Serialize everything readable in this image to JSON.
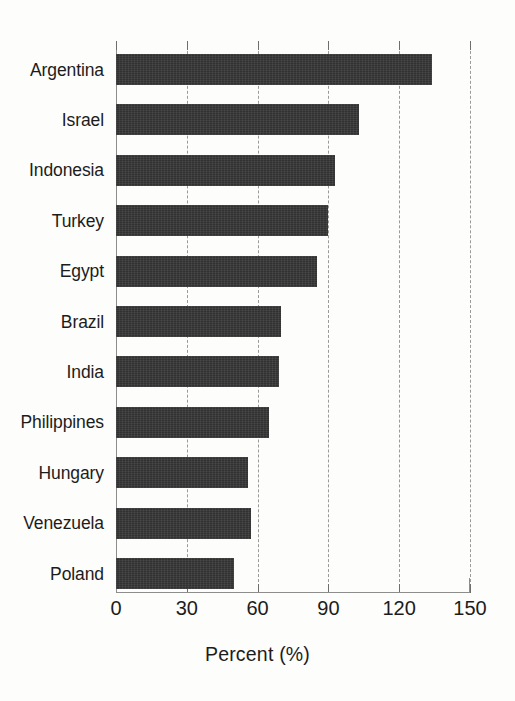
{
  "chart_data": {
    "type": "bar",
    "orientation": "horizontal",
    "title": "",
    "subtitle": "",
    "xlabel": "Percent (%)",
    "ylabel": "",
    "xlim": [
      0,
      150
    ],
    "xticks": [
      0,
      30,
      60,
      90,
      120,
      150
    ],
    "xtick_labels": [
      "0",
      "30",
      "60",
      "90",
      "120",
      "150"
    ],
    "grid": "vertical dashed gridlines at each x tick",
    "legend": "none",
    "categories": [
      "Argentina",
      "Israel",
      "Indonesia",
      "Turkey",
      "Egypt",
      "Brazil",
      "India",
      "Philippines",
      "Hungary",
      "Venezuela",
      "Poland"
    ],
    "values": [
      134,
      103,
      93,
      90,
      85,
      70,
      69,
      65,
      56,
      57,
      50
    ],
    "bar_color": "#363636",
    "background_color": "#fdfdfb",
    "axis_color": "#8d8d8b",
    "text_color": "#1c1c1c"
  },
  "axis": {
    "x_label": "Percent (%)"
  }
}
